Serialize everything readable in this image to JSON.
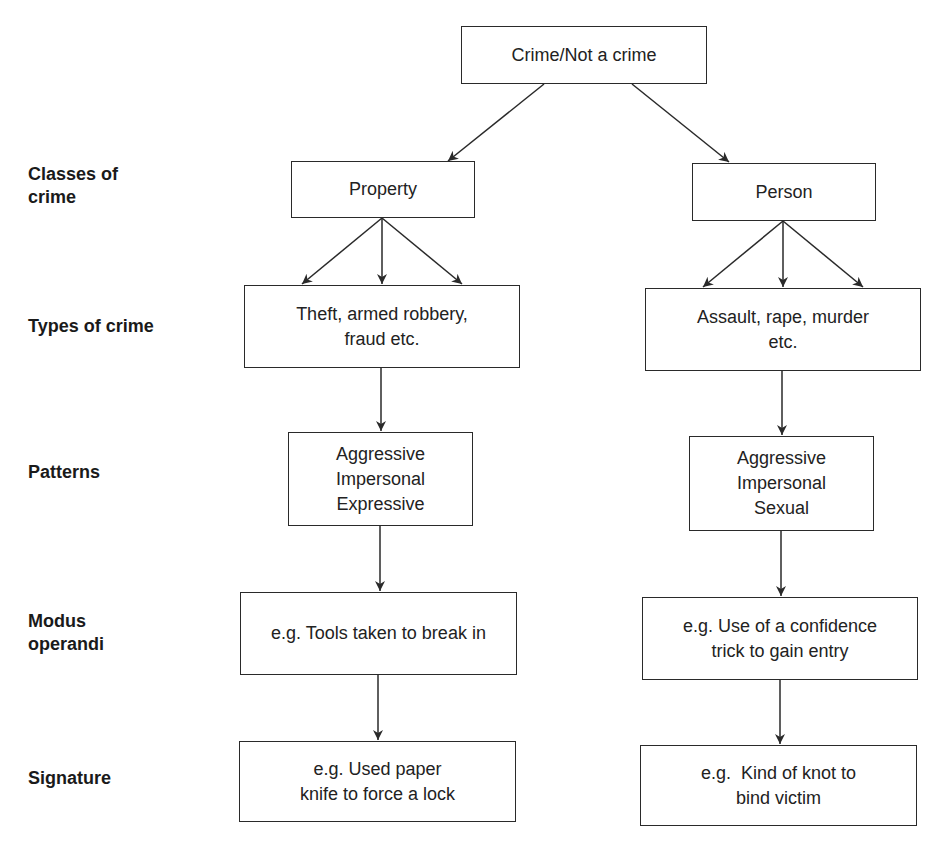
{
  "diagram": {
    "root": {
      "label": "Crime/Not a crime"
    },
    "row_labels": {
      "classes": [
        "Classes of",
        "crime"
      ],
      "types": [
        "Types of crime"
      ],
      "patterns": [
        "Patterns"
      ],
      "modus": [
        "Modus",
        "operandi"
      ],
      "signature": [
        "Signature"
      ]
    },
    "property_branch": {
      "class": {
        "label": "Property"
      },
      "types": {
        "lines": [
          "Theft, armed robbery,",
          "fraud etc."
        ]
      },
      "patterns": {
        "lines": [
          "Aggressive",
          "Impersonal",
          "Expressive"
        ]
      },
      "modus": {
        "lines": [
          "e.g. Tools taken to break in"
        ]
      },
      "signature": {
        "lines": [
          "e.g. Used paper",
          "knife to force a lock"
        ]
      }
    },
    "person_branch": {
      "class": {
        "label": "Person"
      },
      "types": {
        "lines": [
          "Assault, rape, murder",
          "etc."
        ]
      },
      "patterns": {
        "lines": [
          "Aggressive",
          "Impersonal",
          "Sexual"
        ]
      },
      "modus": {
        "lines": [
          "e.g. Use of a confidence",
          "trick to gain entry"
        ]
      },
      "signature": {
        "lines": [
          "e.g.  Kind of knot to",
          "bind victim"
        ]
      }
    },
    "colors": {
      "stroke": "#2a2a2a",
      "text": "#222222",
      "background": "#ffffff"
    }
  }
}
